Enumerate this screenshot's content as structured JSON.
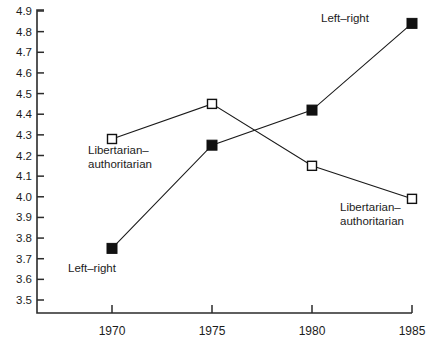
{
  "chart_data": {
    "type": "line",
    "title": "",
    "subtitle": "",
    "xlabel": "",
    "ylabel": "",
    "x": [
      1970,
      1975,
      1980,
      1985
    ],
    "xticklabels": [
      "1970",
      "1975",
      "1980",
      "1985"
    ],
    "yticklabels": [
      "4.9",
      "4.8",
      "4.7",
      "4.6",
      "4.5",
      "4.4",
      "4.3",
      "4.2",
      "4.1",
      "4.0",
      "3.9",
      "3.8",
      "3.7",
      "3.6",
      "3.5"
    ],
    "yticks": [
      4.9,
      4.8,
      4.7,
      4.6,
      4.5,
      4.4,
      4.3,
      4.2,
      4.1,
      4.0,
      3.9,
      3.8,
      3.7,
      3.6,
      3.5
    ],
    "ylim": [
      3.5,
      4.9
    ],
    "xlim": [
      1970,
      1985
    ],
    "grid": false,
    "legend_position": "inline-annotations",
    "series": [
      {
        "name": "Left-right",
        "marker": "filled-square",
        "marker_color": "#111111",
        "line_color": "#1a1a1a",
        "values": [
          3.75,
          4.25,
          4.42,
          4.84
        ]
      },
      {
        "name": "Libertarian-authoritarian",
        "marker": "open-square",
        "marker_color": "#ffffff",
        "line_color": "#1a1a1a",
        "values": [
          4.28,
          4.45,
          4.15,
          3.99
        ]
      }
    ],
    "annotations": [
      {
        "id": "annot-left-right-top",
        "lines": [
          "Left–right"
        ],
        "series": "Left-right",
        "x": 345,
        "y": 22,
        "align": "middle"
      },
      {
        "id": "annot-libertarian-left",
        "lines": [
          "Libertarian–",
          "authoritarian"
        ],
        "series": "Libertarian-authoritarian",
        "x": 88,
        "y": 154,
        "align": "start"
      },
      {
        "id": "annot-libertarian-right",
        "lines": [
          "Libertarian–",
          "authoritarian"
        ],
        "series": "Libertarian-authoritarian",
        "x": 340,
        "y": 211,
        "align": "start"
      },
      {
        "id": "annot-left-right-bottom",
        "lines": [
          "Left–right"
        ],
        "series": "Left-right",
        "x": 68,
        "y": 272,
        "align": "start"
      }
    ],
    "colors": {
      "axis": "#2b2b2b",
      "line": "#1a1a1a",
      "filled_marker": "#111111",
      "open_marker_fill": "#ffffff",
      "text": "#1c1c1c",
      "background": "#ffffff"
    }
  }
}
